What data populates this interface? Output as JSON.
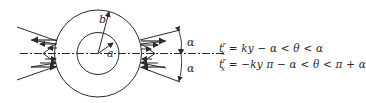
{
  "figure": {
    "labels": {
      "inner_radius": "a",
      "outer_radius": "b",
      "angle_top": "α",
      "angle_bottom": "α"
    },
    "equations": [
      {
        "lhs_base": "t",
        "lhs_sub": "x",
        "lhs_sup": "r",
        "rhs": "= ky   − α < θ < α"
      },
      {
        "lhs_base": "t",
        "lhs_sub": "x",
        "lhs_sup": "r",
        "rhs": "= −ky   π − α < θ < π + α"
      }
    ],
    "colors": {
      "line": "#2a2a2a",
      "background": "#ffffff"
    }
  }
}
